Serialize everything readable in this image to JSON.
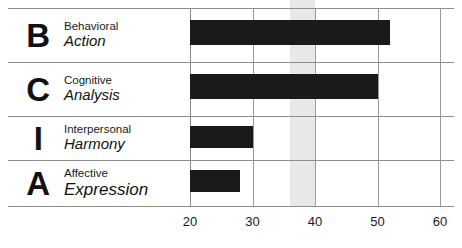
{
  "chart_data": {
    "type": "bar",
    "orientation": "horizontal",
    "title": "",
    "xlabel": "",
    "ylabel": "",
    "xlim": [
      20,
      60
    ],
    "xticks": [
      20,
      30,
      40,
      50,
      60
    ],
    "xtick_labels": [
      "20",
      "30",
      "40",
      "50",
      "60"
    ],
    "grid": true,
    "legend": false,
    "bar_color": "#1a1a1a",
    "highlight_band": {
      "label": "",
      "from": 36,
      "to": 40,
      "color": "#e8e8e8"
    },
    "categories": [
      "B",
      "C",
      "I",
      "A"
    ],
    "values": [
      52,
      50,
      30,
      28
    ],
    "rows": [
      {
        "letter": "B",
        "descriptor": "Behavioral",
        "keyword": "Action",
        "value": 52
      },
      {
        "letter": "C",
        "descriptor": "Cognitive",
        "keyword": "Analysis",
        "value": 50
      },
      {
        "letter": "I",
        "descriptor": "Interpersonal",
        "keyword": "Harmony",
        "value": 30
      },
      {
        "letter": "A",
        "descriptor": "Affective",
        "keyword": "Expression",
        "value": 28
      }
    ]
  }
}
